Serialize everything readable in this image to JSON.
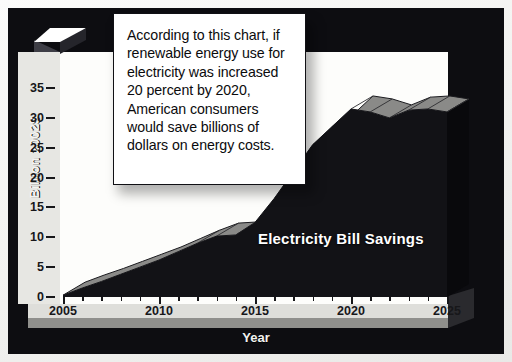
{
  "callout": {
    "text": "According to this chart, if renewable energy use for electricity was increased 20 percent by 2020, American consumers would save billions of dollars on energy costs."
  },
  "series_label": "Electricity Bill Savings",
  "axes": {
    "y_title": "Billion 2002$",
    "x_title": "Year",
    "y_ticks": [
      "0",
      "5",
      "10",
      "15",
      "20",
      "25",
      "30",
      "35"
    ],
    "x_ticks": [
      "2005",
      "2010",
      "2015",
      "2020",
      "2025"
    ]
  },
  "colors": {
    "frame": "#0d0d11",
    "plot_background": "#fdfdfb",
    "area_front": "#121216",
    "area_top": "#8a8a88",
    "area_side": "#09090c",
    "floor": "#dededa",
    "callout_bg": "#ffffff",
    "callout_border": "#101014",
    "label_text": "#ffffff"
  },
  "chart_data": {
    "type": "area",
    "title": "",
    "subtitle": "",
    "xlabel": "Year",
    "ylabel": "Billion 2002$",
    "xlim": [
      2005,
      2025
    ],
    "ylim": [
      0,
      38
    ],
    "grid": false,
    "legend": "none",
    "annotations": [
      "According to this chart, if renewable energy use for electricity was increased 20 percent by 2020, American consumers would save billions of dollars on energy costs."
    ],
    "series": [
      {
        "name": "Electricity Bill Savings",
        "x": [
          2005,
          2006,
          2007,
          2008,
          2009,
          2010,
          2011,
          2012,
          2013,
          2014,
          2015,
          2016,
          2017,
          2018,
          2019,
          2020,
          2021,
          2022,
          2023,
          2024,
          2025
        ],
        "values": [
          0.3,
          1.5,
          2.6,
          3.8,
          5.0,
          6.2,
          7.6,
          9.0,
          10.2,
          10.4,
          12.5,
          16.5,
          21.0,
          25.5,
          28.5,
          31.5,
          31.0,
          30.0,
          31.3,
          31.5,
          31.0
        ]
      }
    ]
  }
}
